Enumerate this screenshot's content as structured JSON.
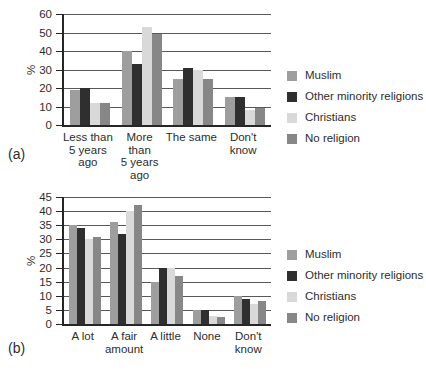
{
  "figure": {
    "background": "#ffffff",
    "text_color": "#2d2d2d"
  },
  "colors": {
    "axis": "#262626",
    "gridline": "#595959",
    "muslim": "#9e9e9e",
    "other_minority_religions": "#2f2f2f",
    "christians": "#d9d9d9",
    "no_religion": "#878787"
  },
  "chart_data": [
    {
      "id": "a",
      "type": "bar",
      "panel_label": "(a)",
      "title": "",
      "xlabel": "",
      "ylabel": "%",
      "ylim": [
        0,
        60
      ],
      "yticks": [
        0,
        10,
        20,
        30,
        40,
        50,
        60
      ],
      "grid": true,
      "legend_position": "right",
      "categories": [
        "Less than 5 years ago",
        "More than 5 years ago",
        "The same",
        "Don't know"
      ],
      "categories_lines": [
        [
          "Less than",
          "5 years",
          "ago"
        ],
        [
          "More than",
          "5 years",
          "ago"
        ],
        [
          "The same"
        ],
        [
          "Don't",
          "know"
        ]
      ],
      "series": [
        {
          "name": "Muslim",
          "color": "#9e9e9e",
          "values": [
            19,
            40,
            25,
            15
          ]
        },
        {
          "name": "Other minority religions",
          "color": "#2f2f2f",
          "values": [
            20,
            33,
            31,
            15
          ]
        },
        {
          "name": "Christians",
          "color": "#d9d9d9",
          "values": [
            12,
            53,
            30,
            8
          ]
        },
        {
          "name": "No religion",
          "color": "#878787",
          "values": [
            12,
            49,
            25,
            9
          ]
        }
      ]
    },
    {
      "id": "b",
      "type": "bar",
      "panel_label": "(b)",
      "title": "",
      "xlabel": "",
      "ylabel": "%",
      "ylim": [
        0,
        45
      ],
      "yticks": [
        0,
        5,
        10,
        15,
        20,
        25,
        30,
        35,
        40,
        45
      ],
      "grid": true,
      "legend_position": "right",
      "categories": [
        "A lot",
        "A fair amount",
        "A little",
        "None",
        "Don't know"
      ],
      "categories_lines": [
        [
          "A lot"
        ],
        [
          "A fair",
          "amount"
        ],
        [
          "A little"
        ],
        [
          "None"
        ],
        [
          "Don't",
          "know"
        ]
      ],
      "series": [
        {
          "name": "Muslim",
          "color": "#9e9e9e",
          "values": [
            35,
            36,
            15,
            5,
            10
          ]
        },
        {
          "name": "Other minority religions",
          "color": "#2f2f2f",
          "values": [
            34,
            32,
            20,
            5,
            9
          ]
        },
        {
          "name": "Christians",
          "color": "#d9d9d9",
          "values": [
            30,
            40,
            20,
            3,
            7
          ]
        },
        {
          "name": "No religion",
          "color": "#878787",
          "values": [
            31,
            42,
            17,
            2.5,
            8
          ]
        }
      ]
    }
  ]
}
